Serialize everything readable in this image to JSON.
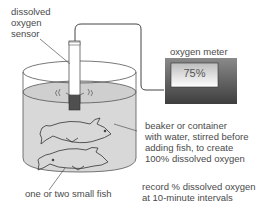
{
  "diagram": {
    "sensor_label": [
      "dissolved",
      "oxygen",
      "sensor"
    ],
    "meter_label": "oxygen meter",
    "meter_reading": "75%",
    "beaker_label": [
      "beaker or container",
      "with water, stirred before",
      "adding fish, to create",
      "100% dissolved oxygen"
    ],
    "fish_label": "one or two small fish",
    "record_label": [
      "record % dissolved oxygen",
      "at 10-minute intervals"
    ],
    "colors": {
      "water": "#d6d6d6",
      "meter_body": "#5a5a5a",
      "meter_screen": "#eeeeee",
      "sensor_tip": "#555555",
      "line": "#444444"
    }
  }
}
